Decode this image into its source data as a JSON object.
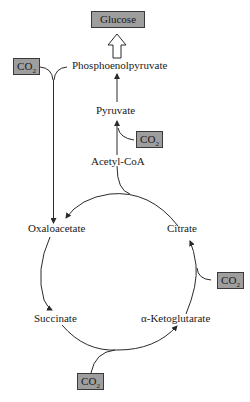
{
  "diagram": {
    "type": "metabolic-pathway",
    "nodes": {
      "glucose": "Glucose",
      "pep": "Phosphoenolpyruvate",
      "pyruvate": "Pyruvate",
      "acetyl_coa": "Acetyl-CoA",
      "oxaloacetate": "Oxaloacetate",
      "citrate": "Citrate",
      "alpha_kg": "α-Ketoglutarate",
      "succinate": "Succinate"
    },
    "co2_boxes": [
      {
        "id": "co2_pep",
        "label": "CO",
        "sub": "2",
        "position": "top-left, joins PEP to oxaloacetate"
      },
      {
        "id": "co2_pyruvate",
        "label": "CO",
        "sub": "2",
        "position": "joins acetyl-CoA to pyruvate"
      },
      {
        "id": "co2_citrate",
        "label": "CO",
        "sub": "2",
        "position": "joins cycle between citrate and alpha-ketoglutarate"
      },
      {
        "id": "co2_succinate",
        "label": "CO",
        "sub": "2",
        "position": "joins cycle between succinate and alpha-ketoglutarate"
      }
    ],
    "edges": [
      {
        "from": "Phosphoenolpyruvate",
        "to": "Glucose",
        "style": "hollow-arrow"
      },
      {
        "from": "Pyruvate",
        "to": "Phosphoenolpyruvate",
        "style": "arrow"
      },
      {
        "from": "Acetyl-CoA",
        "to": "Pyruvate",
        "style": "arrow",
        "with": "CO2"
      },
      {
        "from": "Phosphoenolpyruvate",
        "to": "Oxaloacetate",
        "style": "arrow",
        "with": "CO2"
      },
      {
        "from": "Citrate",
        "to": "Oxaloacetate",
        "style": "arc-arrow",
        "with": "Acetyl-CoA"
      },
      {
        "from": "Oxaloacetate",
        "to": "Succinate",
        "style": "arc-arrow"
      },
      {
        "from": "Succinate",
        "to": "α-Ketoglutarate",
        "style": "arc-arrow",
        "with": "CO2"
      },
      {
        "from": "α-Ketoglutarate",
        "to": "Citrate",
        "style": "arc-arrow",
        "with": "CO2"
      }
    ],
    "colors": {
      "box_fill": "#9e9e9e",
      "box_border": "#3a3a3a",
      "line": "#2a2a2a",
      "text": "#1a1a1a"
    }
  }
}
